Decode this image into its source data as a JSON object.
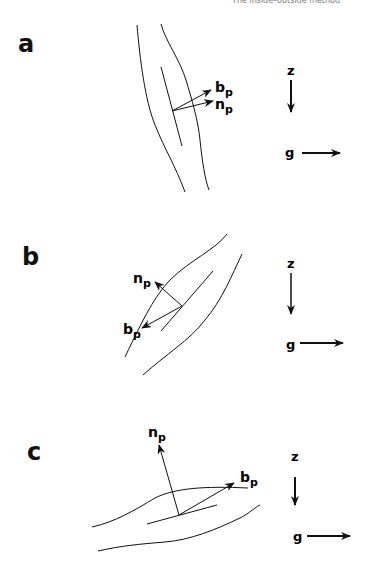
{
  "header": {
    "running_title": "The inside–outside method"
  },
  "panels": [
    {
      "id": "a",
      "label": "a",
      "vectors": [
        {
          "name": "b",
          "subscript": "p"
        },
        {
          "name": "n",
          "subscript": "p"
        }
      ],
      "axes": {
        "z": "z",
        "g": "g"
      }
    },
    {
      "id": "b",
      "label": "b",
      "vectors": [
        {
          "name": "n",
          "subscript": "p"
        },
        {
          "name": "b",
          "subscript": "p"
        }
      ],
      "axes": {
        "z": "z",
        "g": "g"
      }
    },
    {
      "id": "c",
      "label": "c",
      "vectors": [
        {
          "name": "n",
          "subscript": "p"
        },
        {
          "name": "b",
          "subscript": "p"
        }
      ],
      "axes": {
        "z": "z",
        "g": "g"
      }
    }
  ]
}
